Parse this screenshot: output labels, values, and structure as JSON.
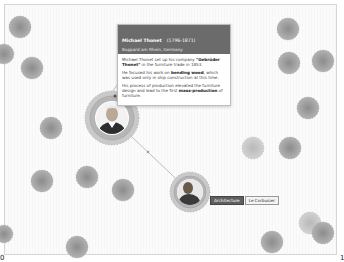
{
  "tooltip": {
    "name": "Michael Thonet",
    "years": "(1796-1871)",
    "place": "Boppard am Rhein, Germany",
    "paragraphs": [
      {
        "pre": "Michael Thonet set up his company ",
        "bold": "\"Gebrüder Thonet\"",
        "post": " in the furniture trade in 1853."
      },
      {
        "pre": "He focused his work on ",
        "bold": "bending wood",
        "post": ", which was used only in ship construction at this time."
      },
      {
        "pre": "His process of production elevated the furniture design and lead to the first ",
        "bold": "mass-production",
        "post": " of furniture."
      }
    ]
  },
  "selected_node": {
    "category_label": "Architecture",
    "person_label": "Le Corbusier"
  },
  "edge_marks": {
    "left": "0",
    "right": "1"
  },
  "colors": {
    "node_fill": "#a9a9a9",
    "node_center": "#8a8a8a",
    "node_light": "#c4c4c4",
    "ring": "#b5b5b5",
    "tooltip_header": "#6b6b6b",
    "edge": "#b0b0b0"
  }
}
